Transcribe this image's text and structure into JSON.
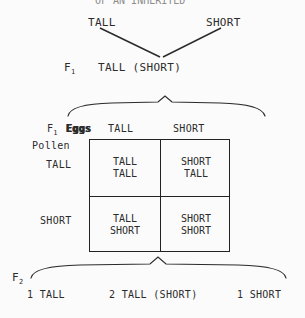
{
  "diagram": {
    "title_cut": "OF AN INHERITED",
    "parents": {
      "left_label": "TALL",
      "right_label": "SHORT"
    },
    "f1": {
      "generation_label": "F",
      "generation_sub": "1",
      "genotype_label": "TALL (SHORT)"
    },
    "punnett": {
      "corner_label_gen": "F",
      "corner_label_sub": "1",
      "corner_label_gametes": "Eggs",
      "row_axis_label": "Pollen",
      "column_headers": [
        "TALL",
        "SHORT"
      ],
      "row_headers": [
        "TALL",
        "SHORT"
      ],
      "cells": [
        [
          {
            "line1": "TALL",
            "line2": "TALL"
          },
          {
            "line1": "SHORT",
            "line2": "TALL"
          }
        ],
        [
          {
            "line1": "TALL",
            "line2": "SHORT"
          },
          {
            "line1": "SHORT",
            "line2": "SHORT"
          }
        ]
      ]
    },
    "f2": {
      "generation_label": "F",
      "generation_sub": "2",
      "ratio": [
        {
          "count": "1",
          "phenotype": "TALL",
          "text": "1 TALL"
        },
        {
          "count": "2",
          "phenotype": "TALL (SHORT)",
          "text": "2 TALL (SHORT)"
        },
        {
          "count": "1",
          "phenotype": "SHORT",
          "text": "1 SHORT"
        }
      ]
    },
    "colors": {
      "ink": "#2b2b2b",
      "rule": "#222222",
      "background": "#fbfbfb"
    }
  }
}
